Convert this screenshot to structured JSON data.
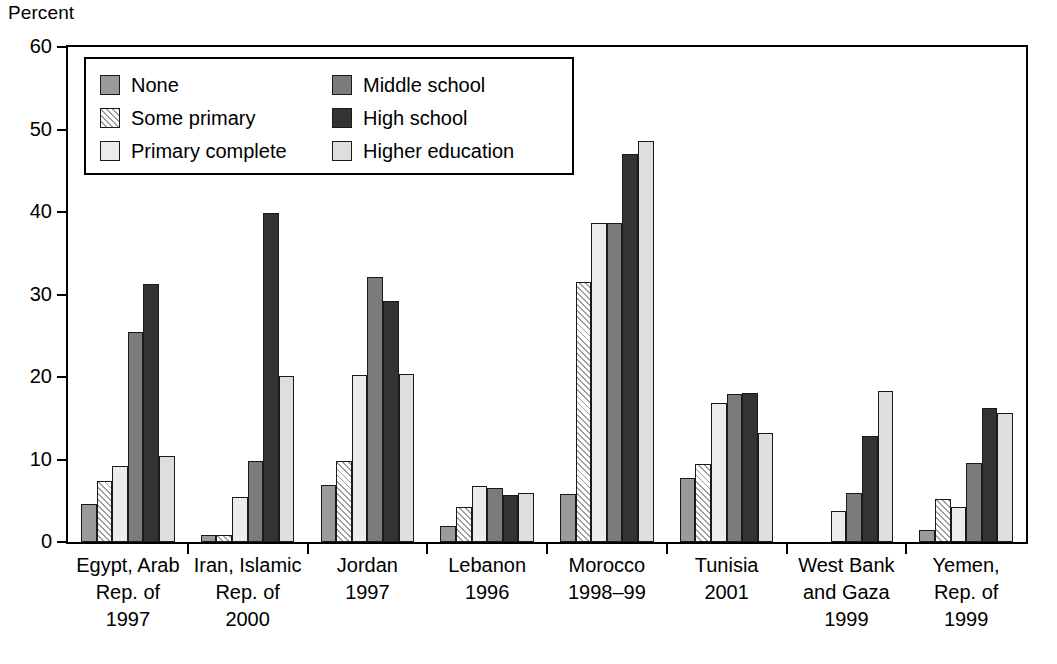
{
  "axis": {
    "y_title": "Percent",
    "y_ticks": [
      0,
      10,
      20,
      30,
      40,
      50,
      60
    ],
    "y_min": 0,
    "y_max": 60
  },
  "legend": {
    "items": [
      {
        "key": "none",
        "label": "None",
        "swatch": "solid-medium-gray"
      },
      {
        "key": "some_primary",
        "label": "Some primary",
        "swatch": "diagonal-hatch"
      },
      {
        "key": "primary_complete",
        "label": "Primary complete",
        "swatch": "solid-very-light-gray"
      },
      {
        "key": "middle_school",
        "label": "Middle school",
        "swatch": "solid-dark-gray"
      },
      {
        "key": "high_school",
        "label": "High school",
        "swatch": "solid-near-black"
      },
      {
        "key": "higher_education",
        "label": "Higher education",
        "swatch": "solid-light-gray"
      }
    ],
    "colors": {
      "none": "#9a9a9a",
      "some_primary": "#ffffff",
      "primary_complete": "#ececec",
      "middle_school": "#7b7b7b",
      "high_school": "#333333",
      "higher_education": "#dedede"
    }
  },
  "chart_data": {
    "type": "bar",
    "title": "",
    "xlabel": "",
    "ylabel": "Percent",
    "ylim": [
      0,
      60
    ],
    "grid": false,
    "legend_position": "inside-top-left",
    "categories": [
      "Egypt, Arab Rep. of 1997",
      "Iran, Islamic Rep. of 2000",
      "Jordan 1997",
      "Lebanon 1996",
      "Morocco 1998–99",
      "Tunisia 2001",
      "West Bank and Gaza 1999",
      "Yemen, Rep. of 1999"
    ],
    "category_lines": [
      [
        "Egypt, Arab",
        "Rep. of",
        "1997"
      ],
      [
        "Iran, Islamic",
        "Rep. of",
        "2000"
      ],
      [
        "Jordan",
        "1997"
      ],
      [
        "Lebanon",
        "1996"
      ],
      [
        "Morocco",
        "1998–99"
      ],
      [
        "Tunisia",
        "2001"
      ],
      [
        "West Bank",
        "and Gaza",
        "1999"
      ],
      [
        "Yemen,",
        "Rep. of",
        "1999"
      ]
    ],
    "series": [
      {
        "name": "None",
        "key": "none",
        "values": [
          4.6,
          0.9,
          6.9,
          2.0,
          5.8,
          7.8,
          null,
          1.5
        ]
      },
      {
        "name": "Some primary",
        "key": "some_primary",
        "values": [
          7.4,
          0.8,
          9.8,
          4.2,
          31.5,
          9.4,
          null,
          5.2
        ]
      },
      {
        "name": "Primary complete",
        "key": "primary_complete",
        "values": [
          9.2,
          5.5,
          20.3,
          6.8,
          38.7,
          16.9,
          3.7,
          4.2
        ]
      },
      {
        "name": "Middle school",
        "key": "middle_school",
        "values": [
          25.4,
          9.8,
          32.1,
          6.5,
          38.7,
          17.9,
          5.9,
          9.6
        ]
      },
      {
        "name": "High school",
        "key": "high_school",
        "values": [
          31.3,
          39.9,
          29.2,
          5.7,
          47.0,
          18.1,
          12.8,
          16.3
        ]
      },
      {
        "name": "Higher education",
        "key": "higher_education",
        "values": [
          10.4,
          20.1,
          20.4,
          5.9,
          48.6,
          13.2,
          18.3,
          15.6
        ]
      }
    ]
  }
}
